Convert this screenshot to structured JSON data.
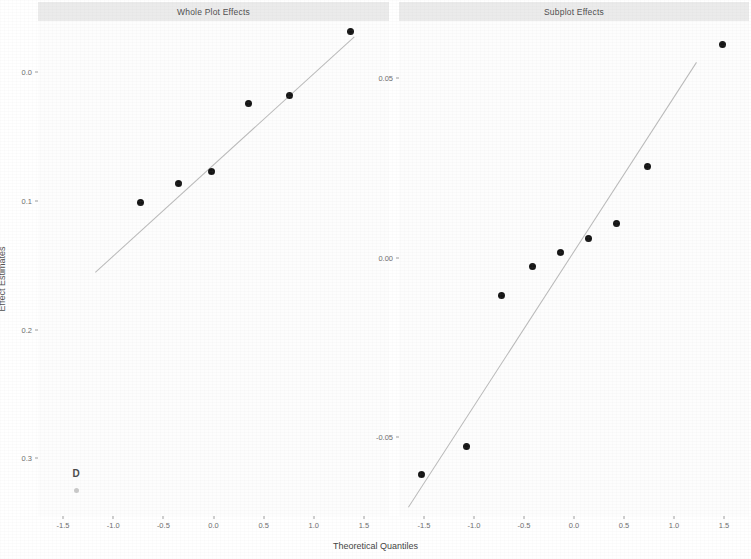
{
  "figure": {
    "x_axis_title": "Theoretical Quantiles",
    "y_axis_title": "Effect Estimates"
  },
  "panels": [
    {
      "title": "Whole Plot Effects"
    },
    {
      "title": "Subplot Effects"
    }
  ],
  "annotations": [
    {
      "text": "D",
      "panel": 0
    }
  ],
  "chart_data": [
    {
      "type": "scatter",
      "title": "Whole Plot Effects",
      "xlabel": "Theoretical Quantiles",
      "ylabel": "Effect Estimates",
      "xlim": [
        -1.75,
        1.75
      ],
      "ylim": [
        -0.345,
        0.04
      ],
      "y_inverted": true,
      "xticks": [
        -1.5,
        -1.0,
        -0.5,
        0.0,
        0.5,
        1.0,
        1.5
      ],
      "xticklabels": [
        "-1.5",
        "-1.0",
        "-0.5",
        "0.0",
        "0.5",
        "1.0",
        "1.5"
      ],
      "yticks": [
        0.0,
        -0.1,
        -0.2,
        -0.3
      ],
      "yticklabels": [
        "0.0",
        "0.1",
        "0.2",
        "0.3"
      ],
      "grid": false,
      "legend": "none",
      "series": [
        {
          "name": "Effect estimates",
          "marker": "filled-circle",
          "points": [
            {
              "x": -1.37,
              "y": -0.325,
              "label": "D",
              "faint": true
            },
            {
              "x": -0.73,
              "y": -0.101
            },
            {
              "x": -0.35,
              "y": -0.086
            },
            {
              "x": -0.02,
              "y": -0.077
            },
            {
              "x": 0.35,
              "y": -0.024
            },
            {
              "x": 0.76,
              "y": -0.018
            },
            {
              "x": 1.37,
              "y": 0.032
            }
          ]
        },
        {
          "name": "Reference line",
          "type": "line",
          "style": "solid-thin",
          "x_start": -1.18,
          "y_start": -0.155,
          "x_end": 1.4,
          "y_end": 0.028
        }
      ]
    },
    {
      "type": "scatter",
      "title": "Subplot Effects",
      "xlabel": "Theoretical Quantiles",
      "ylabel": "Effect Estimates",
      "xlim": [
        -1.75,
        1.75
      ],
      "ylim": [
        -0.072,
        0.066
      ],
      "y_inverted": false,
      "xticks": [
        -1.5,
        -1.0,
        -0.5,
        0.0,
        0.5,
        1.0,
        1.5
      ],
      "xticklabels": [
        "-1.5",
        "-1.0",
        "-0.5",
        "0.0",
        "0.5",
        "1.0",
        "1.5"
      ],
      "yticks": [
        0.05,
        0.0,
        -0.05
      ],
      "yticklabels": [
        "0.05",
        "0.00",
        "-0.05"
      ],
      "grid": false,
      "legend": "none",
      "series": [
        {
          "name": "Effect estimates",
          "marker": "filled-circle",
          "points": [
            {
              "x": -1.53,
              "y": -0.0605
            },
            {
              "x": -1.08,
              "y": -0.0525
            },
            {
              "x": -0.73,
              "y": -0.0105
            },
            {
              "x": -0.42,
              "y": -0.0025
            },
            {
              "x": -0.14,
              "y": 0.0015
            },
            {
              "x": 0.14,
              "y": 0.0055
            },
            {
              "x": 0.42,
              "y": 0.0095
            },
            {
              "x": 0.73,
              "y": 0.0255
            },
            {
              "x": 1.48,
              "y": 0.0595
            }
          ]
        },
        {
          "name": "Reference line",
          "type": "line",
          "style": "solid-thin",
          "x_start": -1.66,
          "y_start": -0.0695,
          "x_end": 1.22,
          "y_end": 0.0545
        }
      ]
    }
  ]
}
